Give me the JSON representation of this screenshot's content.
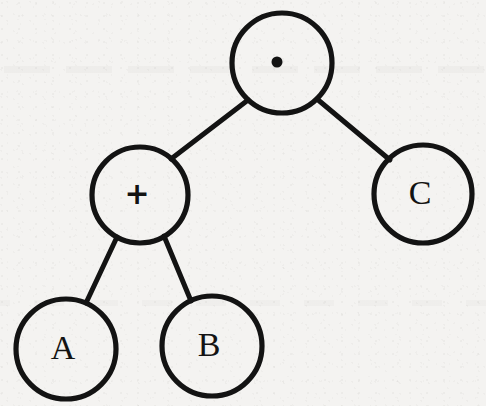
{
  "figure": {
    "type": "binary-expression-tree",
    "expression": "(A + B) · C",
    "background_color": "#f4f3f1",
    "ink_color": "#131313",
    "stroke_width": 5
  },
  "nodes": [
    {
      "id": "root",
      "label": "·",
      "label_kind": "dot",
      "role": "operator",
      "operator_name": "multiply",
      "cx": 282,
      "cy": 63,
      "r": 50
    },
    {
      "id": "plus",
      "label": "+",
      "label_kind": "plus",
      "role": "operator",
      "operator_name": "add",
      "cx": 140,
      "cy": 195,
      "r": 48
    },
    {
      "id": "c",
      "label": "C",
      "label_kind": "letter",
      "role": "operand",
      "operator_name": "",
      "cx": 423,
      "cy": 194,
      "r": 49
    },
    {
      "id": "a",
      "label": "A",
      "label_kind": "letter",
      "role": "operand",
      "operator_name": "",
      "cx": 66,
      "cy": 349,
      "r": 50
    },
    {
      "id": "b",
      "label": "B",
      "label_kind": "letter",
      "role": "operand",
      "operator_name": "",
      "cx": 212,
      "cy": 346,
      "r": 50
    }
  ],
  "edges": [
    {
      "id": "root-plus",
      "from": "root",
      "to": "plus",
      "x1": 248,
      "y1": 100,
      "x2": 171,
      "y2": 159
    },
    {
      "id": "root-c",
      "from": "root",
      "to": "c",
      "x1": 317,
      "y1": 99,
      "x2": 390,
      "y2": 160
    },
    {
      "id": "plus-a",
      "from": "plus",
      "to": "a",
      "x1": 117,
      "y1": 237,
      "x2": 86,
      "y2": 303
    },
    {
      "id": "plus-b",
      "from": "plus",
      "to": "b",
      "x1": 164,
      "y1": 236,
      "x2": 191,
      "y2": 301
    }
  ]
}
